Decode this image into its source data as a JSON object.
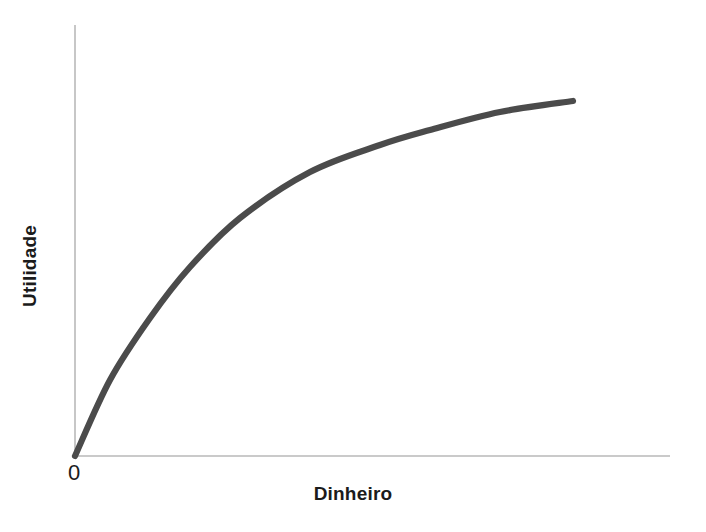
{
  "figure": {
    "background_color": "#ffffff",
    "width": 706,
    "height": 532
  },
  "labels": {
    "y_axis": "Utilidade",
    "x_axis": "Dinheiro",
    "origin": "0"
  },
  "style": {
    "curve_color": "#4b4b4b",
    "axis_color": "#b9b9b9",
    "text_color": "#1b1b1b"
  },
  "chart_data": {
    "type": "line",
    "title": "",
    "subtitle": "",
    "xlabel": "Dinheiro",
    "ylabel": "Utilidade",
    "legend": [],
    "legend_position": "none",
    "grid": false,
    "xlim": [
      0,
      1.2
    ],
    "ylim": [
      0,
      1.1
    ],
    "axis_ticks": {
      "x": [
        "0"
      ],
      "y": []
    },
    "annotations": [
      {
        "text": "0",
        "x": 0,
        "y": 0,
        "position": "below-origin"
      }
    ],
    "series": [
      {
        "name": "Utilidade do dinheiro",
        "color": "#4b4b4b",
        "x": [
          0.0,
          0.05,
          0.1,
          0.15,
          0.2,
          0.25,
          0.3,
          0.35,
          0.4,
          0.45,
          0.5,
          0.55,
          0.6,
          0.65,
          0.7,
          0.75,
          0.8,
          0.85,
          0.9,
          0.95,
          1.0
        ],
        "y": [
          0.0,
          0.126,
          0.24,
          0.342,
          0.433,
          0.514,
          0.587,
          0.652,
          0.71,
          0.762,
          0.808,
          0.849,
          0.886,
          0.919,
          0.948,
          0.974,
          0.997,
          1.018,
          1.036,
          1.053,
          1.068
        ]
      }
    ],
    "curve_pixel_points": [
      {
        "x": 75,
        "y": 456
      },
      {
        "x": 110,
        "y": 380
      },
      {
        "x": 150,
        "y": 318
      },
      {
        "x": 190,
        "y": 267
      },
      {
        "x": 240,
        "y": 218
      },
      {
        "x": 310,
        "y": 172
      },
      {
        "x": 380,
        "y": 145
      },
      {
        "x": 430,
        "y": 130
      },
      {
        "x": 500,
        "y": 112
      },
      {
        "x": 573,
        "y": 101
      }
    ],
    "axes_pixel_geometry": {
      "origin": {
        "x": 75,
        "y": 456
      },
      "y_axis_top": {
        "x": 75,
        "y": 25
      },
      "x_axis_right": {
        "x": 670,
        "y": 456
      }
    }
  }
}
